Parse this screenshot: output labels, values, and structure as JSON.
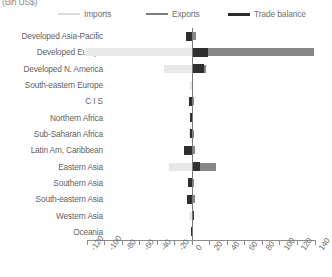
{
  "unit_label": "(Bln US$)",
  "legend": {
    "items": [
      {
        "label": "Imports",
        "color": "#dcdcdc",
        "key": "imports"
      },
      {
        "label": "Exports",
        "color": "#7c7c7c",
        "key": "exports"
      },
      {
        "label": "Trade balance",
        "color": "#2b2b2b",
        "key": "balance"
      }
    ]
  },
  "chart_data": {
    "type": "bar",
    "orientation": "horizontal",
    "title": "",
    "subtitle": "",
    "xlabel": "(Bln US$)",
    "ylabel": "",
    "xlim": [
      -120,
      140
    ],
    "xticks": [
      -120,
      -100,
      -80,
      -60,
      -40,
      -20,
      0,
      20,
      40,
      60,
      80,
      100,
      120,
      140
    ],
    "xtick_labels": [
      "-120",
      "-100",
      "-80",
      "-60",
      "-40",
      "-20",
      "0",
      "20",
      "40",
      "60",
      "80",
      "100",
      "120",
      "140"
    ],
    "grid": false,
    "legend_position": "top",
    "zero_line": 0,
    "categories": [
      "Developed Asia-Pacific",
      "Developed Europe",
      "Developed N. America",
      "South-eastern Europe",
      "C I S",
      "Northern Africa",
      "Sub-Saharan Africa",
      "Latin Am, Caribbean",
      "Eastern Asia",
      "Southern Asia",
      "South-eastern Asia",
      "Western Asia",
      "Oceania"
    ],
    "series": [
      {
        "name": "Imports",
        "color": "#e8e8e8",
        "values": [
          -4,
          -122,
          -32,
          -2,
          -2,
          -2,
          -3,
          -4,
          -26,
          -3,
          -4,
          -3,
          -1
        ]
      },
      {
        "name": "Exports",
        "color": "#878787",
        "values": [
          5,
          140,
          16,
          2,
          3,
          2,
          3,
          4,
          28,
          3,
          4,
          3,
          1
        ]
      },
      {
        "name": "Trade balance",
        "color": "#2e2e2e",
        "values": [
          -6,
          18,
          14,
          1,
          -3,
          -2,
          -2,
          -9,
          10,
          -4,
          -5,
          3,
          -1
        ]
      }
    ]
  }
}
